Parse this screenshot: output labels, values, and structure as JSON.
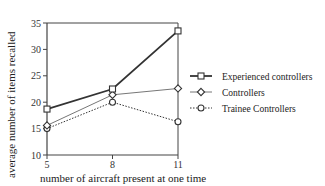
{
  "chart_data": {
    "type": "line",
    "title": "",
    "xlabel": "number of aircraft present at one time",
    "ylabel": "average number of items recalled",
    "x": [
      5,
      8,
      11
    ],
    "categories": [
      "5",
      "8",
      "11"
    ],
    "ylim": [
      10,
      35
    ],
    "yticks": [
      10,
      15,
      20,
      25,
      30,
      35
    ],
    "grid": false,
    "legend_position": "right",
    "series": [
      {
        "name": "Experienced controllers",
        "values": [
          18.7,
          22.5,
          33.5
        ],
        "marker": "square",
        "line": "solid-thick",
        "color": "#333333"
      },
      {
        "name": "Controllers",
        "values": [
          15.6,
          21.4,
          22.6
        ],
        "marker": "diamond",
        "line": "solid-thin",
        "color": "#666666"
      },
      {
        "name": "Trainee Controllers",
        "values": [
          15.0,
          20.0,
          16.3
        ],
        "marker": "circle",
        "line": "dotted",
        "color": "#333333"
      }
    ]
  },
  "labels": {
    "xlabel": "number of aircraft present at one time",
    "ylabel": "average number of items recalled"
  }
}
